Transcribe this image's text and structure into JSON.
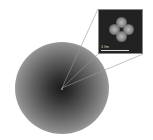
{
  "figure": {
    "inset": {
      "scale_label": "1 fm"
    },
    "colors": {
      "cloud_center": "#1a1a1a",
      "inset_background": "#222222",
      "lobe": "#bbbbbb"
    }
  }
}
